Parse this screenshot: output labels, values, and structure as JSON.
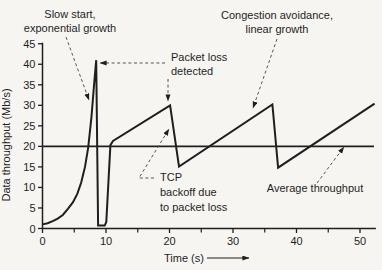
{
  "figure_title": "TCP throughput over time",
  "chart_data": {
    "type": "line",
    "title": "",
    "xlabel": "Time (s)",
    "ylabel": "Data throughput (Mb/s)",
    "xlim": [
      0,
      52.5
    ],
    "ylim": [
      0,
      45
    ],
    "x_ticks_labeled": [
      0,
      10,
      20,
      30,
      40,
      50
    ],
    "x_ticks_minor": [
      5,
      15,
      25,
      35,
      45
    ],
    "y_ticks": [
      0,
      5,
      10,
      15,
      20,
      25,
      30,
      35,
      40,
      45
    ],
    "grid": false,
    "legend": "annotations on plot (no legend box)",
    "line_color": "#1f1f1f",
    "leader_color": "#555555",
    "series": [
      {
        "name": "TCP throughput (slow start, congestion avoidance, backoff sawtooth)",
        "points": [
          [
            0,
            1
          ],
          [
            0.8,
            1.3
          ],
          [
            1.6,
            1.8
          ],
          [
            2.4,
            2.4
          ],
          [
            3.2,
            3.3
          ],
          [
            4,
            4.8
          ],
          [
            4.8,
            6.4
          ],
          [
            5.5,
            8.5
          ],
          [
            6.1,
            11.2
          ],
          [
            6.7,
            15
          ],
          [
            7.2,
            19.7
          ],
          [
            7.7,
            27
          ],
          [
            8.1,
            34.5
          ],
          [
            8.45,
            41
          ],
          [
            8.75,
            0.7
          ],
          [
            9.8,
            0.7
          ],
          [
            10.05,
            1.6
          ],
          [
            10.7,
            20.3
          ],
          [
            11.1,
            21.3
          ],
          [
            20.1,
            30
          ],
          [
            21.5,
            15.1
          ],
          [
            36.2,
            30.2
          ],
          [
            37.1,
            14.8
          ],
          [
            52.3,
            30.4
          ]
        ]
      },
      {
        "name": "Average throughput",
        "points": [
          [
            0.1,
            20
          ],
          [
            52.2,
            20
          ]
        ]
      }
    ],
    "annotations": [
      {
        "id": "slow-start",
        "lines": [
          "Slow start,",
          "exponential growth"
        ],
        "anchor": "middle",
        "x": 70,
        "baselines": [
          18,
          32
        ],
        "arrow": [
          [
            66,
            37
          ],
          [
            89,
            100
          ]
        ]
      },
      {
        "id": "packet-loss-detected",
        "lines": [
          "Packet loss",
          "detected"
        ],
        "anchor": "start",
        "x": 171,
        "baselines": [
          61,
          75
        ],
        "arrow": [
          [
            165,
            63
          ],
          [
            100,
            63
          ]
        ],
        "arrow2": [
          [
            168,
            79
          ],
          [
            168,
            101
          ]
        ]
      },
      {
        "id": "congestion-avoidance",
        "lines": [
          "Congestion avoidance,",
          "linear growth"
        ],
        "anchor": "middle",
        "x": 277,
        "baselines": [
          19,
          33
        ],
        "arrow": [
          [
            277,
            39
          ],
          [
            253,
            108
          ]
        ]
      },
      {
        "id": "tcp-backoff",
        "lines": [
          "TCP",
          "backoff due",
          "to packet loss"
        ],
        "anchor": "start",
        "x": 160,
        "baselines": [
          181,
          196,
          211
        ],
        "arrow": [
          [
            154,
            178
          ],
          [
            139,
            178
          ],
          [
            169,
            129
          ]
        ]
      },
      {
        "id": "average-throughput",
        "lines": [
          "Average throughput"
        ],
        "anchor": "middle",
        "x": 315,
        "baselines": [
          192
        ],
        "arrow": [
          [
            317,
            183
          ],
          [
            344,
            147
          ]
        ]
      }
    ],
    "xaxis_arrow": [
      [
        207,
        258
      ],
      [
        249,
        258
      ]
    ],
    "layout_px": {
      "x0": 42.5,
      "px_per_s": 6.35,
      "y0": 228.5,
      "px_per_unit": 4.106,
      "xlabel_x": 184,
      "xlabel_y": 262,
      "ylabel_x": 10,
      "ylabel_y": 145
    }
  }
}
